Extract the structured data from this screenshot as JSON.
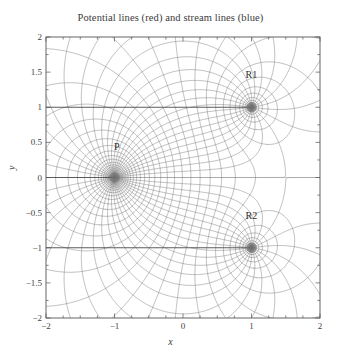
{
  "chart_data": {
    "type": "line",
    "title": "Potential lines (red) and stream lines (blue)",
    "xlabel": "x",
    "ylabel": "y",
    "xlim": [
      -2,
      2
    ],
    "ylim": [
      -2,
      2
    ],
    "xticks": [
      -2,
      -1,
      0,
      1,
      2
    ],
    "xticklabels": [
      "−2",
      "−1",
      "0",
      "1",
      "2"
    ],
    "yticks": [
      -2,
      -1.5,
      -1,
      -0.5,
      0,
      0.5,
      1,
      1.5,
      2
    ],
    "yticklabels": [
      "−2",
      "−1.5",
      "−1",
      "−0.5",
      "0",
      "0.5",
      "1",
      "1.5",
      "2"
    ],
    "minor_tick_step": 0.25,
    "grid": false,
    "legend": "none",
    "series": [
      {
        "name": "Potential lines (red)",
        "role": "equipotential",
        "color": "#6a6a6a",
        "description": "Level curves of the real part of the complex potential; they radiate outward from each singularity."
      },
      {
        "name": "Stream lines (blue)",
        "role": "streamline",
        "color": "#6a6a6a",
        "description": "Level curves of the imaginary part of the complex potential; orthogonal family encircling each singularity."
      }
    ],
    "singularities": [
      {
        "label": "P",
        "x": -1,
        "y": 0,
        "strength": 2,
        "label_offset_x": 0.08,
        "label_offset_y": 0.42
      },
      {
        "label": "R1",
        "x": 1,
        "y": 1,
        "strength": -1,
        "label_offset_x": -0.06,
        "label_offset_y": 0.44
      },
      {
        "label": "R2",
        "x": 1,
        "y": -1,
        "strength": -1,
        "label_offset_x": -0.06,
        "label_offset_y": 0.44
      }
    ],
    "branch_cuts": [
      {
        "from_x": -2,
        "from_y": 0,
        "to_x": -1,
        "to_y": 0,
        "emphasis": "strong"
      },
      {
        "from_x": -2,
        "from_y": 1,
        "to_x": 1,
        "to_y": 1,
        "emphasis": "strong"
      },
      {
        "from_x": -2,
        "from_y": -1,
        "to_x": 1,
        "to_y": -1,
        "emphasis": "strong"
      },
      {
        "from_x": -1,
        "from_y": 0,
        "to_x": 2,
        "to_y": 0,
        "emphasis": "light"
      }
    ],
    "annotations": [
      {
        "text": "P",
        "x": -0.92,
        "y": 0.42
      },
      {
        "text": "R1",
        "x": 1.0,
        "y": 1.44
      },
      {
        "text": "R2",
        "x": 1.0,
        "y": -0.56
      }
    ]
  },
  "plot_area": {
    "left_px": 46,
    "top_px": 37,
    "width_px": 274,
    "height_px": 281,
    "frame_color": "#555555",
    "background": "#ffffff"
  },
  "style": {
    "curve_color": "#737373",
    "curve_color_dark": "#4a4a4a",
    "text_color": "#3a3a3a"
  }
}
